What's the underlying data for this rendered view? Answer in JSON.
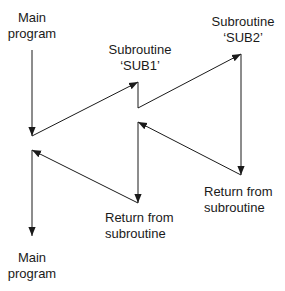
{
  "diagram": {
    "type": "flow",
    "labels": {
      "main_top": {
        "line1": "Main",
        "line2": "program"
      },
      "sub1": {
        "line1": "Subroutine",
        "line2": "‘SUB1’"
      },
      "sub2": {
        "line1": "Subroutine",
        "line2": "‘SUB2’"
      },
      "return_sub2": {
        "line1": "Return from",
        "line2": "subroutine"
      },
      "return_sub1": {
        "line1": "Return from",
        "line2": "subroutine"
      },
      "main_bottom": {
        "line1": "Main",
        "line2": "program"
      }
    },
    "colors": {
      "line": "#1a1a1a",
      "background": "#ffffff"
    },
    "edges": [
      {
        "from": "main-program-start",
        "to": "call-sub1-point",
        "label": "main program executes"
      },
      {
        "from": "call-sub1-point",
        "to": "sub1-entry",
        "label": "call SUB1"
      },
      {
        "from": "sub1-entry",
        "to": "call-sub2-point",
        "label": "SUB1 executes"
      },
      {
        "from": "call-sub2-point",
        "to": "sub2-entry",
        "label": "call SUB2"
      },
      {
        "from": "sub2-entry",
        "to": "sub2-return",
        "label": "SUB2 executes"
      },
      {
        "from": "sub2-return",
        "to": "sub1-resume",
        "label": "return to SUB1"
      },
      {
        "from": "sub1-resume",
        "to": "sub1-return",
        "label": "SUB1 continues"
      },
      {
        "from": "sub1-return",
        "to": "main-resume",
        "label": "return to main"
      },
      {
        "from": "main-resume",
        "to": "main-program-end",
        "label": "main program continues"
      }
    ]
  }
}
